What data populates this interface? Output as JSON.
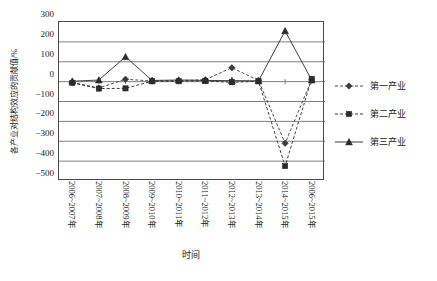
{
  "chart_data": {
    "type": "line",
    "title": "",
    "xlabel": "时间",
    "ylabel": "各产业对结构效应的贡献值/%",
    "ylim": [
      -500,
      300
    ],
    "yticks": [
      300,
      200,
      100,
      0,
      -100,
      -200,
      -300,
      -400,
      -500
    ],
    "ytick_labels": [
      "300",
      "200",
      "100",
      "0",
      "−100",
      "−200",
      "−300",
      "−400",
      "−500"
    ],
    "grid": "horizontal",
    "legend_position": "right",
    "categories": [
      "2006~2007年",
      "2007~2008年",
      "2008~2009年",
      "2009~2010年",
      "2010~2011年",
      "2011~2012年",
      "2012~2013年",
      "2013~2014年",
      "2014~2015年",
      "2006~2015年"
    ],
    "series": [
      {
        "name": "第一产业",
        "marker": "diamond",
        "line_style": "dashed",
        "color": "#3a3a3a",
        "values": [
          -4,
          -32,
          12,
          3,
          5,
          10,
          70,
          6,
          -310,
          10
        ]
      },
      {
        "name": "第二产业",
        "marker": "square",
        "line_style": "dashed",
        "color": "#2b2b2b",
        "values": [
          -6,
          -35,
          -34,
          2,
          2,
          3,
          -3,
          2,
          -425,
          14
        ]
      },
      {
        "name": "第三産业",
        "marker": "triangle",
        "line_style": "solid",
        "color": "#2b2b2b",
        "values": [
          2,
          8,
          125,
          6,
          8,
          6,
          5,
          4,
          255,
          8
        ]
      }
    ]
  },
  "legend": {
    "items": [
      {
        "label": "第一产业"
      },
      {
        "label": "第二产业"
      },
      {
        "label": "第三产业"
      }
    ]
  }
}
